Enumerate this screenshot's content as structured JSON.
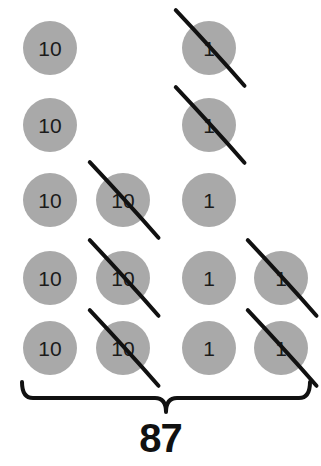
{
  "canvas": {
    "width": 321,
    "height": 466,
    "background": "#ffffff"
  },
  "style": {
    "counter_fill": "#a9a9a9",
    "counter_text_color": "#1b1b1b",
    "strike_color": "#111111",
    "brace_color": "#111111",
    "total_color": "#111111",
    "counter_radius": 27,
    "strike_width": 4,
    "brace_width": 4
  },
  "columns": [
    {
      "name": "tens-column-1",
      "x": 50,
      "place": "tens"
    },
    {
      "name": "tens-column-2",
      "x": 123,
      "place": "tens"
    },
    {
      "name": "ones-column-1",
      "x": 209,
      "place": "ones"
    },
    {
      "name": "ones-column-2",
      "x": 281,
      "place": "ones"
    }
  ],
  "rows": [
    48,
    125,
    200,
    278,
    348
  ],
  "counters": [
    {
      "id": "counter-r1c1",
      "label": "10",
      "place": "tens",
      "cx": 50,
      "cy": 48,
      "r": 27,
      "crossed": false
    },
    {
      "id": "counter-r1c3",
      "label": "1",
      "place": "ones",
      "cx": 209,
      "cy": 48,
      "r": 27,
      "crossed": true
    },
    {
      "id": "counter-r2c1",
      "label": "10",
      "place": "tens",
      "cx": 50,
      "cy": 125,
      "r": 27,
      "crossed": false
    },
    {
      "id": "counter-r2c3",
      "label": "1",
      "place": "ones",
      "cx": 209,
      "cy": 125,
      "r": 27,
      "crossed": true
    },
    {
      "id": "counter-r3c1",
      "label": "10",
      "place": "tens",
      "cx": 50,
      "cy": 200,
      "r": 27,
      "crossed": false
    },
    {
      "id": "counter-r3c2",
      "label": "10",
      "place": "tens",
      "cx": 123,
      "cy": 200,
      "r": 27,
      "crossed": true
    },
    {
      "id": "counter-r3c3",
      "label": "1",
      "place": "ones",
      "cx": 209,
      "cy": 200,
      "r": 27,
      "crossed": false
    },
    {
      "id": "counter-r4c1",
      "label": "10",
      "place": "tens",
      "cx": 50,
      "cy": 278,
      "r": 27,
      "crossed": false
    },
    {
      "id": "counter-r4c2",
      "label": "10",
      "place": "tens",
      "cx": 123,
      "cy": 278,
      "r": 27,
      "crossed": true
    },
    {
      "id": "counter-r4c3",
      "label": "1",
      "place": "ones",
      "cx": 209,
      "cy": 278,
      "r": 27,
      "crossed": false
    },
    {
      "id": "counter-r4c4",
      "label": "1",
      "place": "ones",
      "cx": 281,
      "cy": 278,
      "r": 27,
      "crossed": true
    },
    {
      "id": "counter-r5c1",
      "label": "10",
      "place": "tens",
      "cx": 50,
      "cy": 348,
      "r": 27,
      "crossed": false
    },
    {
      "id": "counter-r5c2",
      "label": "10",
      "place": "tens",
      "cx": 123,
      "cy": 348,
      "r": 27,
      "crossed": true
    },
    {
      "id": "counter-r5c3",
      "label": "1",
      "place": "ones",
      "cx": 209,
      "cy": 348,
      "r": 27,
      "crossed": false
    },
    {
      "id": "counter-r5c4",
      "label": "1",
      "place": "ones",
      "cx": 281,
      "cy": 348,
      "r": 27,
      "crossed": true
    }
  ],
  "brace": {
    "left_x": 22,
    "right_x": 310,
    "top_y": 382,
    "mid_y": 398,
    "tip_y": 412
  },
  "total": {
    "value": "87",
    "y": 418
  },
  "chart_data": {
    "type": "table",
    "title": "87",
    "xlabel": "",
    "ylabel": "",
    "categories": [
      "tens",
      "ones"
    ],
    "series": [
      {
        "name": "counters shown",
        "values": [
          8,
          7
        ]
      },
      {
        "name": "counters crossed out",
        "values": [
          3,
          4
        ]
      }
    ],
    "annotations": [
      "87"
    ]
  }
}
